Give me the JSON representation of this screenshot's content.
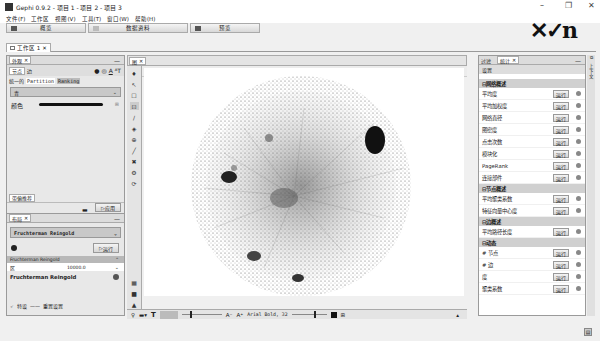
{
  "window": {
    "title": "Gephi 0.9.2 - 项目 1 - 项目 2 - 项目 3",
    "controls": {
      "minimize": "–",
      "restore": "❐",
      "close": "✕"
    }
  },
  "menu": [
    "文件(F)",
    "工作区",
    "视图(V)",
    "工具(T)",
    "窗口(W)",
    "帮助(H)"
  ],
  "modes": [
    {
      "label": "概览",
      "icon": "overview-icon"
    },
    {
      "label": "数据资料",
      "icon": "data-lab-icon"
    },
    {
      "label": "预览",
      "icon": "preview-icon"
    }
  ],
  "brand_logo": "✕✓n",
  "workspace_tab": {
    "label": "工作区 1",
    "close": "✕"
  },
  "appearance_panel": {
    "tab_label": "外观",
    "subtabs": [
      "节点",
      "边"
    ],
    "modes": [
      "统一的",
      "Partition",
      "Ranking"
    ],
    "color_select": "青",
    "color_label": "颜色",
    "auto_apply_label": "带偏推荐",
    "apply_label": "应用"
  },
  "layout_panel": {
    "tab_label": "布局",
    "algorithm": "Fruchterman Reingold",
    "run_label": "运行",
    "prop_header": "Fruchterman Reingold",
    "area_label": "区",
    "area_value": "10000.0",
    "desc_title": "Fruchterman Reingold",
    "footer_reset": "重置设置",
    "footer_preset": "特设"
  },
  "graph_panel": {
    "tab_label": "图",
    "toolbar_label": "拖动（直到读取数据）",
    "bottom": {
      "font": "Arial Bold, 32"
    }
  },
  "stats_panel": {
    "tabs": [
      "过滤",
      "统计"
    ],
    "settings_label": "设置",
    "run_label": "运行",
    "sections": [
      {
        "title": "网络概述",
        "items": [
          "平均度",
          "平均加权度",
          "网络直径",
          "图密度",
          "点击次数",
          "模块化",
          "PageRank",
          "连接部件"
        ]
      },
      {
        "title": "节点概述",
        "items": [
          "平均聚类系数",
          "特征向量中心度"
        ]
      },
      {
        "title": "边概述",
        "items": [
          "平均路径长度"
        ]
      },
      {
        "title": "动态",
        "items": [
          "# 节点",
          "# 边",
          "度",
          "聚类系数"
        ]
      }
    ]
  }
}
